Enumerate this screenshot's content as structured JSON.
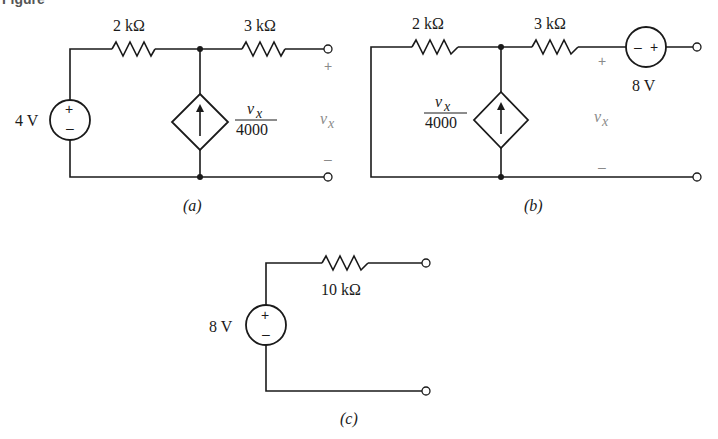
{
  "figure": {
    "caption_partial": "Figure"
  },
  "panels": {
    "a": {
      "label": "(a)",
      "source": {
        "value": "4 V",
        "plus": "+",
        "minus": "–"
      },
      "r1": "2 kΩ",
      "r2": "3 kΩ",
      "dependent_source": {
        "numerator": "v",
        "numerator_sub": "x",
        "denominator": "4000"
      },
      "output": {
        "plus": "+",
        "minus": "–",
        "var": "v",
        "var_sub": "x"
      }
    },
    "b": {
      "label": "(b)",
      "r1": "2 kΩ",
      "r2": "3 kΩ",
      "dependent_source": {
        "numerator": "v",
        "numerator_sub": "x",
        "denominator": "4000"
      },
      "series_source": {
        "value": "8 V",
        "minus": "–",
        "plus": "+"
      },
      "output": {
        "plus": "+",
        "minus": "–",
        "var": "v",
        "var_sub": "x"
      }
    },
    "c": {
      "label": "(c)",
      "source": {
        "value": "8 V",
        "plus": "+",
        "minus": "–"
      },
      "r1": "10 kΩ"
    }
  },
  "colors": {
    "line": "#1a1a1a",
    "muted_label": "#8a8a8a",
    "background": "#ffffff"
  }
}
